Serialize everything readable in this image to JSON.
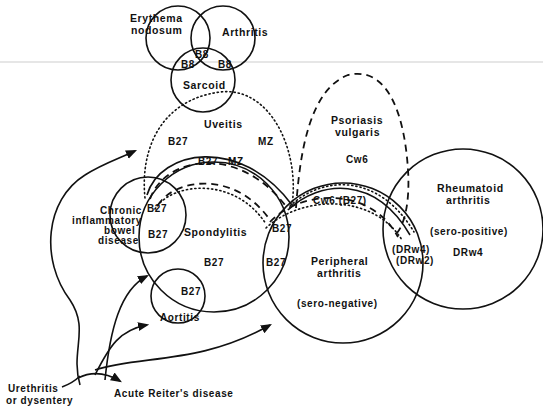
{
  "figure": {
    "type": "venn-style association diagram",
    "colors": {
      "ink": "#111111",
      "background": "#ffffff"
    }
  },
  "top_cluster": {
    "erythema_nodosum": [
      "Erythema",
      "nodosum"
    ],
    "arthritis": "Arthritis",
    "sarcoid": "Sarcoid",
    "overlaps": {
      "center": "B8",
      "left": "B8",
      "right": "B8"
    }
  },
  "uveitis": {
    "label": "Uveitis",
    "outer_left_marker": "B27",
    "outer_right_marker": "MZ",
    "inner_left_marker": "B27",
    "inner_right_marker": "MZ"
  },
  "psoriasis": {
    "label": [
      "Psoriasis",
      "vulgaris"
    ],
    "marker": "Cw6",
    "overlap_marker": "Cw6 (B27)"
  },
  "chronic_ibd": {
    "label": [
      "Chronic",
      "inflammatory",
      "bowel",
      "disease"
    ],
    "overlap_top_marker": "B27",
    "overlap_marker": "B27"
  },
  "spondylitis": {
    "label": "Spondylitis",
    "marker": "B27"
  },
  "aortitis": {
    "label": "Aortitis",
    "overlap_marker": "B27"
  },
  "peripheral_arthritis": {
    "label": [
      "Peripheral",
      "arthritis"
    ],
    "sublabel": "(sero-negative)",
    "overlap_top_marker": "B27",
    "overlap_marker": "B27"
  },
  "rheumatoid_arthritis": {
    "label": [
      "Rheumatoid",
      "arthritis"
    ],
    "sublabel": "(sero-positive)",
    "marker": "DRw4",
    "overlap_markers": [
      "(DRw4)",
      "(DRw2)"
    ]
  },
  "origin": {
    "label": [
      "Urethritis",
      "or dysentery"
    ],
    "outcome": "Acute Reiter's disease"
  }
}
